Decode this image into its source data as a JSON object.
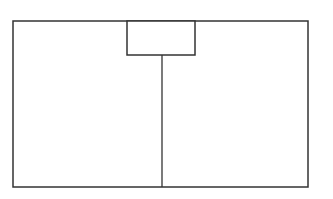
{
  "diagram": {
    "type": "line-drawing",
    "stroke_color": "#333333",
    "background_color": "#ffffff",
    "outer_rect": {
      "x": 13,
      "y": 21,
      "width": 295,
      "height": 166
    },
    "top_box": {
      "x": 127,
      "y": 21,
      "width": 68,
      "height": 34
    },
    "divider_line": {
      "x": 162,
      "y1": 55,
      "y2": 187
    }
  }
}
